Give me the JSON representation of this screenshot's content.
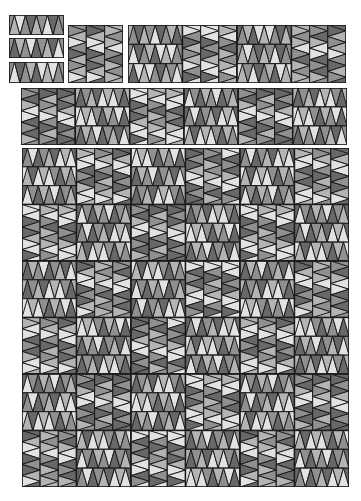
{
  "diagram": {
    "colors": {
      "light": "#e2e2e2",
      "midlight": "#b4b4b4",
      "mid": "#909090",
      "dark": "#686868",
      "outline": "#1c1c1c",
      "background": "#ffffff"
    },
    "palette_sequence": [
      "midlight",
      "light",
      "mid",
      "dark",
      "midlight",
      "mid",
      "light",
      "dark",
      "mid",
      "midlight",
      "dark",
      "light"
    ],
    "strip": {
      "triangles_per_strip": 9
    },
    "pieces": [
      {
        "id": "strip-1",
        "type": "strip",
        "orient": "h",
        "x": 9,
        "y": 15,
        "w": 55,
        "h": 20,
        "offset": 0
      },
      {
        "id": "strip-2",
        "type": "strip",
        "orient": "h",
        "x": 9,
        "y": 38,
        "w": 55,
        "h": 20,
        "offset": 3
      },
      {
        "id": "strip-3",
        "type": "strip",
        "orient": "h",
        "x": 9,
        "y": 62,
        "w": 55,
        "h": 21,
        "offset": 6
      },
      {
        "id": "block-v-top",
        "type": "block",
        "orient": "v",
        "x": 68,
        "y": 25,
        "w": 55,
        "h": 58,
        "offset": 1
      },
      {
        "id": "row-unit-top",
        "type": "row",
        "x": 128,
        "y": 25,
        "w": 218,
        "h": 58,
        "pattern": [
          "h",
          "v",
          "h",
          "v"
        ],
        "offset": 2
      },
      {
        "id": "band-row",
        "type": "row",
        "x": 21,
        "y": 88,
        "w": 326,
        "h": 57,
        "pattern": [
          "v",
          "h",
          "v",
          "h",
          "v",
          "h"
        ],
        "offset": 4
      },
      {
        "id": "quilt-top",
        "type": "grid",
        "x": 22,
        "y": 148,
        "w": 327,
        "h": 339,
        "rows": 6,
        "cols": 6,
        "first": "h",
        "offset": 5
      }
    ]
  }
}
